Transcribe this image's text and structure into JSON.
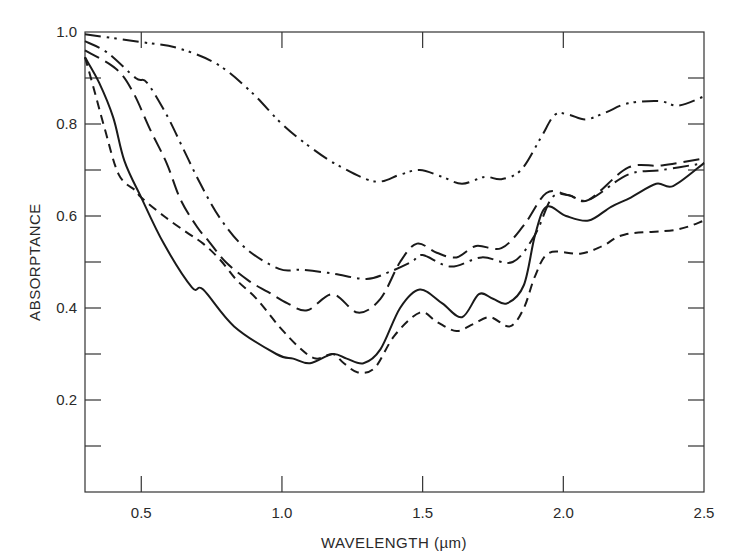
{
  "chart_data": {
    "type": "line",
    "title": "",
    "xlabel": "WAVELENGTH (µm)",
    "ylabel": "ABSORPTANCE",
    "xlim": [
      0.3,
      2.5
    ],
    "ylim": [
      0.0,
      1.0
    ],
    "x_ticks": [
      {
        "value": 0.5,
        "label": "0.5"
      },
      {
        "value": 1.0,
        "label": "1.0"
      },
      {
        "value": 1.5,
        "label": "1.5"
      },
      {
        "value": 2.0,
        "label": "2.0"
      },
      {
        "value": 2.5,
        "label": "2.5"
      }
    ],
    "y_ticks": [
      {
        "value": 0.1,
        "label": ""
      },
      {
        "value": 0.2,
        "label": "0.2"
      },
      {
        "value": 0.3,
        "label": ""
      },
      {
        "value": 0.4,
        "label": "0.4"
      },
      {
        "value": 0.5,
        "label": ""
      },
      {
        "value": 0.6,
        "label": "0.6"
      },
      {
        "value": 0.7,
        "label": ""
      },
      {
        "value": 0.8,
        "label": "0.8"
      },
      {
        "value": 0.9,
        "label": ""
      },
      {
        "value": 1.0,
        "label": "1.0"
      }
    ],
    "grid": false,
    "legend": null,
    "series": [
      {
        "name": "dash-dot-dot curve",
        "line_style": "dash-dot-dot",
        "points": [
          [
            0.3,
            0.995
          ],
          [
            0.5,
            0.978
          ],
          [
            0.63,
            0.965
          ],
          [
            0.77,
            0.93
          ],
          [
            0.89,
            0.87
          ],
          [
            1.0,
            0.8
          ],
          [
            1.1,
            0.75
          ],
          [
            1.2,
            0.71
          ],
          [
            1.33,
            0.675
          ],
          [
            1.42,
            0.69
          ],
          [
            1.49,
            0.7
          ],
          [
            1.57,
            0.685
          ],
          [
            1.64,
            0.67
          ],
          [
            1.72,
            0.685
          ],
          [
            1.78,
            0.68
          ],
          [
            1.85,
            0.7
          ],
          [
            1.92,
            0.77
          ],
          [
            1.97,
            0.82
          ],
          [
            2.02,
            0.82
          ],
          [
            2.08,
            0.81
          ],
          [
            2.15,
            0.825
          ],
          [
            2.23,
            0.845
          ],
          [
            2.34,
            0.85
          ],
          [
            2.41,
            0.84
          ],
          [
            2.5,
            0.86
          ]
        ]
      },
      {
        "name": "dash-dot curve",
        "line_style": "dash-dot",
        "points": [
          [
            0.3,
            0.98
          ],
          [
            0.38,
            0.955
          ],
          [
            0.48,
            0.9
          ],
          [
            0.52,
            0.89
          ],
          [
            0.59,
            0.82
          ],
          [
            0.65,
            0.745
          ],
          [
            0.71,
            0.67
          ],
          [
            0.78,
            0.595
          ],
          [
            0.87,
            0.53
          ],
          [
            0.99,
            0.485
          ],
          [
            1.07,
            0.483
          ],
          [
            1.18,
            0.475
          ],
          [
            1.3,
            0.463
          ],
          [
            1.38,
            0.478
          ],
          [
            1.46,
            0.5
          ],
          [
            1.5,
            0.515
          ],
          [
            1.6,
            0.49
          ],
          [
            1.71,
            0.51
          ],
          [
            1.82,
            0.5
          ],
          [
            1.9,
            0.56
          ],
          [
            1.96,
            0.64
          ],
          [
            2.02,
            0.645
          ],
          [
            2.09,
            0.635
          ],
          [
            2.23,
            0.69
          ],
          [
            2.35,
            0.7
          ],
          [
            2.5,
            0.715
          ]
        ]
      },
      {
        "name": "long-dash curve",
        "line_style": "long-dash",
        "points": [
          [
            0.3,
            0.96
          ],
          [
            0.41,
            0.92
          ],
          [
            0.47,
            0.87
          ],
          [
            0.53,
            0.79
          ],
          [
            0.59,
            0.715
          ],
          [
            0.64,
            0.635
          ],
          [
            0.7,
            0.575
          ],
          [
            0.74,
            0.545
          ],
          [
            0.8,
            0.5
          ],
          [
            0.88,
            0.46
          ],
          [
            0.95,
            0.435
          ],
          [
            1.02,
            0.41
          ],
          [
            1.09,
            0.395
          ],
          [
            1.18,
            0.43
          ],
          [
            1.27,
            0.39
          ],
          [
            1.35,
            0.42
          ],
          [
            1.42,
            0.5
          ],
          [
            1.48,
            0.54
          ],
          [
            1.55,
            0.52
          ],
          [
            1.62,
            0.51
          ],
          [
            1.69,
            0.535
          ],
          [
            1.78,
            0.53
          ],
          [
            1.86,
            0.58
          ],
          [
            1.94,
            0.65
          ],
          [
            2.02,
            0.645
          ],
          [
            2.09,
            0.635
          ],
          [
            2.23,
            0.705
          ],
          [
            2.35,
            0.71
          ],
          [
            2.5,
            0.725
          ]
        ]
      },
      {
        "name": "solid curve",
        "line_style": "solid",
        "points": [
          [
            0.3,
            0.945
          ],
          [
            0.35,
            0.89
          ],
          [
            0.4,
            0.815
          ],
          [
            0.44,
            0.72
          ],
          [
            0.5,
            0.64
          ],
          [
            0.58,
            0.54
          ],
          [
            0.68,
            0.445
          ],
          [
            0.72,
            0.44
          ],
          [
            0.83,
            0.36
          ],
          [
            0.98,
            0.3
          ],
          [
            1.04,
            0.29
          ],
          [
            1.1,
            0.28
          ],
          [
            1.18,
            0.3
          ],
          [
            1.23,
            0.29
          ],
          [
            1.29,
            0.28
          ],
          [
            1.35,
            0.31
          ],
          [
            1.42,
            0.4
          ],
          [
            1.49,
            0.44
          ],
          [
            1.57,
            0.41
          ],
          [
            1.64,
            0.38
          ],
          [
            1.7,
            0.43
          ],
          [
            1.75,
            0.42
          ],
          [
            1.8,
            0.41
          ],
          [
            1.86,
            0.45
          ],
          [
            1.9,
            0.56
          ],
          [
            1.94,
            0.62
          ],
          [
            2.01,
            0.6
          ],
          [
            2.09,
            0.59
          ],
          [
            2.17,
            0.62
          ],
          [
            2.24,
            0.64
          ],
          [
            2.33,
            0.67
          ],
          [
            2.39,
            0.665
          ],
          [
            2.5,
            0.715
          ]
        ]
      },
      {
        "name": "short-dash curve",
        "line_style": "short-dash",
        "points": [
          [
            0.3,
            0.945
          ],
          [
            0.33,
            0.88
          ],
          [
            0.37,
            0.79
          ],
          [
            0.42,
            0.69
          ],
          [
            0.48,
            0.655
          ],
          [
            0.5,
            0.64
          ],
          [
            0.58,
            0.6
          ],
          [
            0.66,
            0.565
          ],
          [
            0.72,
            0.54
          ],
          [
            0.78,
            0.505
          ],
          [
            0.84,
            0.46
          ],
          [
            0.91,
            0.42
          ],
          [
            0.99,
            0.36
          ],
          [
            1.06,
            0.315
          ],
          [
            1.12,
            0.29
          ],
          [
            1.18,
            0.3
          ],
          [
            1.22,
            0.28
          ],
          [
            1.27,
            0.26
          ],
          [
            1.33,
            0.27
          ],
          [
            1.4,
            0.34
          ],
          [
            1.49,
            0.39
          ],
          [
            1.55,
            0.37
          ],
          [
            1.62,
            0.35
          ],
          [
            1.68,
            0.365
          ],
          [
            1.74,
            0.38
          ],
          [
            1.81,
            0.36
          ],
          [
            1.86,
            0.4
          ],
          [
            1.9,
            0.47
          ],
          [
            1.95,
            0.52
          ],
          [
            2.06,
            0.518
          ],
          [
            2.14,
            0.535
          ],
          [
            2.22,
            0.56
          ],
          [
            2.4,
            0.57
          ],
          [
            2.5,
            0.59
          ]
        ]
      }
    ]
  }
}
